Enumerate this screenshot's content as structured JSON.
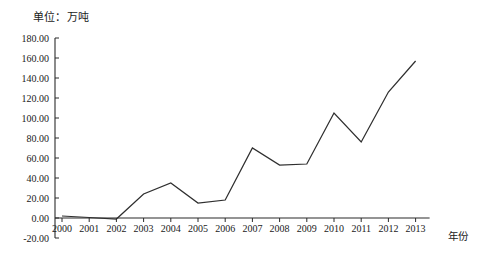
{
  "chart_data": {
    "type": "line",
    "title": "",
    "unit_label": "单位：万吨",
    "xlabel": "年份",
    "ylabel": "",
    "categories": [
      "2000",
      "2001",
      "2002",
      "2003",
      "2004",
      "2005",
      "2006",
      "2007",
      "2008",
      "2009",
      "2010",
      "2011",
      "2012",
      "2013"
    ],
    "x": [
      2000,
      2001,
      2002,
      2003,
      2004,
      2005,
      2006,
      2007,
      2008,
      2009,
      2010,
      2011,
      2012,
      2013
    ],
    "values": [
      2.0,
      0.5,
      -1.0,
      24.0,
      35.0,
      15.0,
      18.0,
      70.0,
      53.0,
      54.0,
      105.0,
      76.0,
      126.0,
      157.0
    ],
    "series": [
      {
        "name": "",
        "values": [
          2.0,
          0.5,
          -1.0,
          24.0,
          35.0,
          15.0,
          18.0,
          70.0,
          53.0,
          54.0,
          105.0,
          76.0,
          126.0,
          157.0
        ]
      }
    ],
    "ylim": [
      -20.0,
      180.0
    ],
    "ytick_step": 20.0,
    "ytick_labels": [
      "180.00",
      "160.00",
      "140.00",
      "120.00",
      "100.00",
      "80.00",
      "60.00",
      "40.00",
      "20.00",
      "0.00",
      "-20.00"
    ],
    "ytick_values": [
      180.0,
      160.0,
      140.0,
      120.0,
      100.0,
      80.0,
      60.0,
      40.0,
      20.0,
      0.0,
      -20.0
    ],
    "grid": false,
    "legend": null,
    "legend_position": "none",
    "line_color": "#2f2f2f",
    "axis_color": "#2b2b2b",
    "background_color": "#ffffff"
  }
}
